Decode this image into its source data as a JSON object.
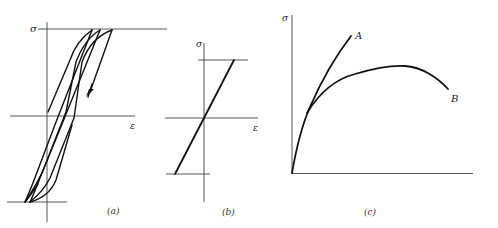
{
  "figure": {
    "panels": [
      {
        "id": "a",
        "caption": "(a)",
        "y_label": "σ",
        "x_label": "ε",
        "description": "Cyclic stress-strain hysteresis loops with ratcheting; arrow indicates unloading direction"
      },
      {
        "id": "b",
        "caption": "(b)",
        "y_label": "σ",
        "x_label": "ε",
        "description": "Linear elastic stress-strain line between stress limits"
      },
      {
        "id": "c",
        "caption": "(c)",
        "y_label": "σ",
        "curves": [
          {
            "label": "A",
            "description": "Monotonically rising curve"
          },
          {
            "label": "B",
            "description": "Curve rising to a maximum then softening"
          }
        ]
      }
    ]
  },
  "colors": {
    "ink": "#111111",
    "axis": "#444444",
    "background": "#ffffff"
  }
}
